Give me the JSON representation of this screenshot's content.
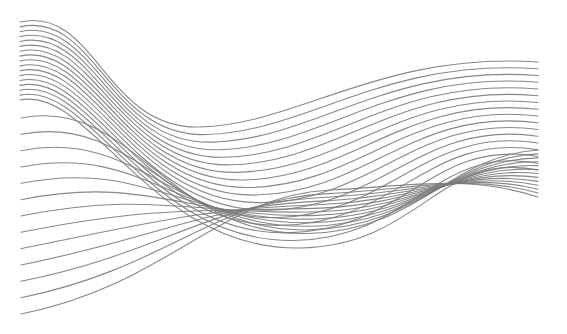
{
  "artwork": {
    "kind": "abstract-wave-lines",
    "background": "#ffffff",
    "stroke_color": "#7a7a7a",
    "stroke_width": 1.1,
    "stroke_opacity": 0.9,
    "line_count": 30,
    "top_curve": {
      "start": [
        20,
        22
      ],
      "c1": [
        95,
        5
      ],
      "c2": [
        105,
        130
      ],
      "mid": [
        200,
        127
      ],
      "c3": [
        300,
        124
      ],
      "c4": [
        380,
        52
      ],
      "end": [
        538,
        62
      ]
    },
    "bottom_curve": {
      "start": [
        22,
        314
      ],
      "c1": [
        140,
        285
      ],
      "c2": [
        220,
        195
      ],
      "mid": [
        330,
        190
      ],
      "c3": [
        420,
        185
      ],
      "c4": [
        470,
        175
      ],
      "end": [
        538,
        197
      ]
    },
    "sag_curve": {
      "start": [
        20,
        100
      ],
      "c1": [
        90,
        85
      ],
      "c2": [
        150,
        250
      ],
      "mid": [
        300,
        248
      ],
      "c3": [
        420,
        246
      ],
      "c4": [
        440,
        150
      ],
      "end": [
        538,
        170
      ]
    }
  }
}
